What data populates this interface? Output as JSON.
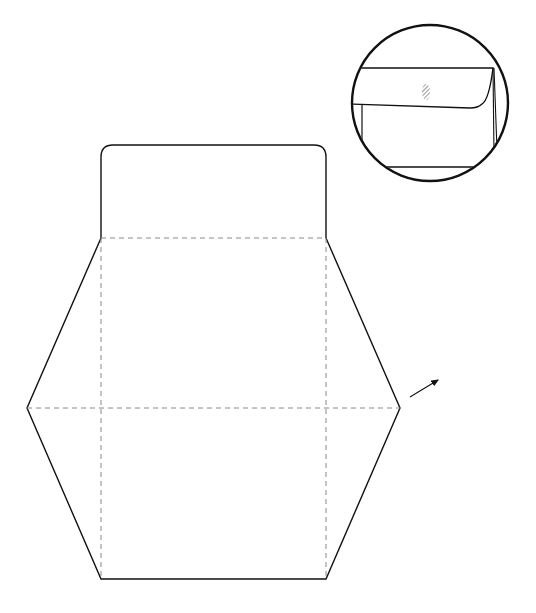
{
  "diagram": {
    "type": "envelope-template",
    "colors": {
      "line": "#111111",
      "fold": "#888888",
      "background": "#ffffff"
    },
    "template": {
      "flap": {
        "x": 101,
        "y": 145,
        "width": 225,
        "height": 93,
        "corner_radius": 12
      },
      "outline_points": [
        [
          101,
          238
        ],
        [
          27,
          408
        ],
        [
          101,
          579
        ],
        [
          326,
          579
        ],
        [
          400,
          408
        ],
        [
          326,
          238
        ]
      ],
      "fold_lines": [
        {
          "x1": 101,
          "y1": 238,
          "x2": 326,
          "y2": 238
        },
        {
          "x1": 27,
          "y1": 408,
          "x2": 400,
          "y2": 408
        },
        {
          "x1": 101,
          "y1": 238,
          "x2": 101,
          "y2": 579
        },
        {
          "x1": 326,
          "y1": 238,
          "x2": 326,
          "y2": 579
        }
      ]
    },
    "arrow": {
      "x1": 410,
      "y1": 397,
      "x2": 440,
      "y2": 379
    },
    "detail_inset": {
      "cx": 430,
      "cy": 103,
      "r": 78,
      "label": "folded envelope detail"
    }
  }
}
